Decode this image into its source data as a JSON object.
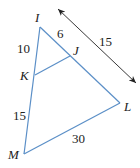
{
  "diagram": {
    "type": "triangle with parallel segment",
    "colors": {
      "segment": "#5b8fc7",
      "arrow": "#222222",
      "text": "#222222"
    },
    "vertices": {
      "I": {
        "label": "I",
        "x": 40,
        "y": 27
      },
      "J": {
        "label": "J",
        "x": 70,
        "y": 56
      },
      "K": {
        "label": "K",
        "x": 35,
        "y": 75
      },
      "L": {
        "label": "L",
        "x": 120,
        "y": 103
      },
      "M": {
        "label": "M",
        "x": 24,
        "y": 154
      }
    },
    "lengths": {
      "IK": "10",
      "IJ": "6",
      "KM": "15",
      "ML": "30",
      "JL": "15"
    },
    "measure_arrow": {
      "from": [
        58,
        9
      ],
      "to": [
        136,
        83
      ],
      "label": "15"
    }
  }
}
